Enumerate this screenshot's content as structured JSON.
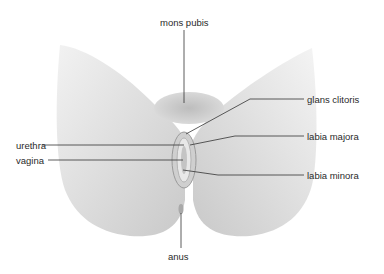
{
  "diagram": {
    "type": "anatomical-illustration",
    "style": "grayscale",
    "labels": {
      "mons_pubis": "mons pubis",
      "glans_clitoris": "glans clitoris",
      "labia_majora": "labia majora",
      "urethra": "urethra",
      "vagina": "vagina",
      "labia_minora": "labia minora",
      "anus": "anus"
    },
    "colors": {
      "background": "#ffffff",
      "figure": "#d6d6d6",
      "leader_line": "#333333",
      "text": "#2a2a2a"
    }
  }
}
